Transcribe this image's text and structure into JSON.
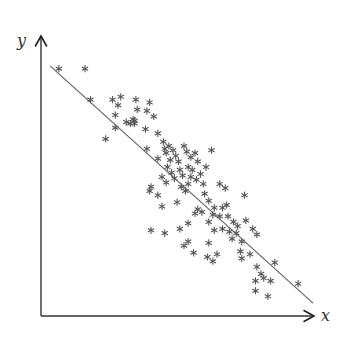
{
  "chart_data": {
    "type": "scatter",
    "title": "",
    "xlabel": "x",
    "ylabel": "y",
    "marker": "*",
    "grid": false,
    "legend": null,
    "xlim": [
      0,
      10
    ],
    "ylim": [
      0,
      10
    ],
    "axis_origin_px": [
      41,
      316
    ],
    "px_per_unit": [
      27.5,
      28.1
    ],
    "regression_line": {
      "x": [
        0.33,
        9.89
      ],
      "y": [
        8.9,
        0.46
      ],
      "color": "#666666"
    },
    "points": [
      [
        0.65,
        8.8
      ],
      [
        1.6,
        8.8
      ],
      [
        1.8,
        7.7
      ],
      [
        2.6,
        7.7
      ],
      [
        2.8,
        7.5
      ],
      [
        2.9,
        7.8
      ],
      [
        3.45,
        7.7
      ],
      [
        3.5,
        7.35
      ],
      [
        3.4,
        6.95
      ],
      [
        3.95,
        7.6
      ],
      [
        3.85,
        7.3
      ],
      [
        2.7,
        7.15
      ],
      [
        2.7,
        6.7
      ],
      [
        3.1,
        6.9
      ],
      [
        3.25,
        6.85
      ],
      [
        2.35,
        6.3
      ],
      [
        3.35,
        7.0
      ],
      [
        3.4,
        6.85
      ],
      [
        3.8,
        6.65
      ],
      [
        4.1,
        7.1
      ],
      [
        4.25,
        6.5
      ],
      [
        3.85,
        5.95
      ],
      [
        4.45,
        6.2
      ],
      [
        4.55,
        5.8
      ],
      [
        4.25,
        5.6
      ],
      [
        4.7,
        5.55
      ],
      [
        4.5,
        5.95
      ],
      [
        4.65,
        6.05
      ],
      [
        4.8,
        5.9
      ],
      [
        4.9,
        5.7
      ],
      [
        5.0,
        5.5
      ],
      [
        5.2,
        6.05
      ],
      [
        5.3,
        5.85
      ],
      [
        5.45,
        5.65
      ],
      [
        5.6,
        5.8
      ],
      [
        5.7,
        5.5
      ],
      [
        4.6,
        5.3
      ],
      [
        4.75,
        5.1
      ],
      [
        4.4,
        4.95
      ],
      [
        4.55,
        4.75
      ],
      [
        4.85,
        4.9
      ],
      [
        5.05,
        5.2
      ],
      [
        5.15,
        5.0
      ],
      [
        5.35,
        5.3
      ],
      [
        5.5,
        5.2
      ],
      [
        5.45,
        4.95
      ],
      [
        5.65,
        4.85
      ],
      [
        5.8,
        5.05
      ],
      [
        5.9,
        4.7
      ],
      [
        5.1,
        4.6
      ],
      [
        5.25,
        4.45
      ],
      [
        5.35,
        4.7
      ],
      [
        4.0,
        4.6
      ],
      [
        4.95,
        4.05
      ],
      [
        4.4,
        3.9
      ],
      [
        4.25,
        4.3
      ],
      [
        3.95,
        4.45
      ],
      [
        6.0,
        5.3
      ],
      [
        6.2,
        5.9
      ],
      [
        5.95,
        4.35
      ],
      [
        6.1,
        4.1
      ],
      [
        6.3,
        3.85
      ],
      [
        5.6,
        3.65
      ],
      [
        5.7,
        3.8
      ],
      [
        5.85,
        3.7
      ],
      [
        6.1,
        3.35
      ],
      [
        6.25,
        3.6
      ],
      [
        6.5,
        3.55
      ],
      [
        6.6,
        3.85
      ],
      [
        6.75,
        3.95
      ],
      [
        6.8,
        3.55
      ],
      [
        7.0,
        3.35
      ],
      [
        7.15,
        3.2
      ],
      [
        6.85,
        3.0
      ],
      [
        6.6,
        3.1
      ],
      [
        6.95,
        2.75
      ],
      [
        7.1,
        2.95
      ],
      [
        7.3,
        2.65
      ],
      [
        7.45,
        3.4
      ],
      [
        7.7,
        3.1
      ],
      [
        7.85,
        2.9
      ],
      [
        6.3,
        3.05
      ],
      [
        6.1,
        2.6
      ],
      [
        5.35,
        3.3
      ],
      [
        5.2,
        2.5
      ],
      [
        5.35,
        2.65
      ],
      [
        5.55,
        2.25
      ],
      [
        6.05,
        2.1
      ],
      [
        6.25,
        1.95
      ],
      [
        6.4,
        2.2
      ],
      [
        7.25,
        2.3
      ],
      [
        7.6,
        2.2
      ],
      [
        7.85,
        1.75
      ],
      [
        8.0,
        1.5
      ],
      [
        7.8,
        1.25
      ],
      [
        8.1,
        1.35
      ],
      [
        7.8,
        0.9
      ],
      [
        8.5,
        1.9
      ],
      [
        8.35,
        1.25
      ],
      [
        9.35,
        1.15
      ],
      [
        8.25,
        0.7
      ],
      [
        5.05,
        3.1
      ],
      [
        6.5,
        4.7
      ],
      [
        6.7,
        4.55
      ],
      [
        7.4,
        4.3
      ],
      [
        7.3,
        2.05
      ],
      [
        4.0,
        3.05
      ],
      [
        4.5,
        2.95
      ]
    ]
  }
}
